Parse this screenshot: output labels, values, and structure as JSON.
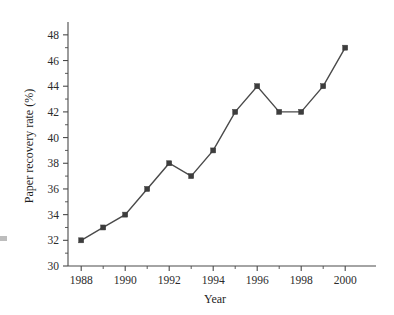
{
  "chart_data": {
    "type": "line",
    "title": "",
    "subtitle": "",
    "xlabel": "Year",
    "ylabel": "Paper recovery rate (%)",
    "x": [
      1988,
      1989,
      1990,
      1991,
      1992,
      1993,
      1994,
      1995,
      1996,
      1997,
      1998,
      1999,
      2000
    ],
    "values": [
      32,
      33,
      34,
      36,
      38,
      37,
      39,
      42,
      44,
      42,
      42,
      44,
      47
    ],
    "series": [
      {
        "name": "Paper recovery rate",
        "values": [
          32,
          33,
          34,
          36,
          38,
          37,
          39,
          42,
          44,
          42,
          42,
          44,
          47
        ]
      }
    ],
    "xlim": [
      1987.4,
      2001.4
    ],
    "ylim": [
      30,
      49
    ],
    "x_tick_labels": [
      "1988",
      "1990",
      "1992",
      "1994",
      "1996",
      "1998",
      "2000"
    ],
    "x_tick_values": [
      1988,
      1990,
      1992,
      1994,
      1996,
      1998,
      2000
    ],
    "x_minor_tick_values": [
      1989,
      1991,
      1993,
      1995,
      1997,
      1999
    ],
    "y_tick_labels": [
      "30",
      "32",
      "34",
      "36",
      "38",
      "40",
      "42",
      "44",
      "46",
      "48"
    ],
    "y_tick_values": [
      30,
      32,
      34,
      36,
      38,
      40,
      42,
      44,
      46,
      48
    ],
    "y_minor_tick_values": [
      31,
      33,
      35,
      37,
      39,
      41,
      43,
      45,
      47
    ],
    "grid": false,
    "legend": false,
    "legend_position": "none",
    "marker": "square",
    "line_color": "#4a4a4a",
    "marker_color": "#3d3d3d",
    "background_color": "#ffffff",
    "annotations": []
  },
  "axes": {
    "y_title": "Paper recovery rate (%)",
    "x_title": "Year"
  }
}
